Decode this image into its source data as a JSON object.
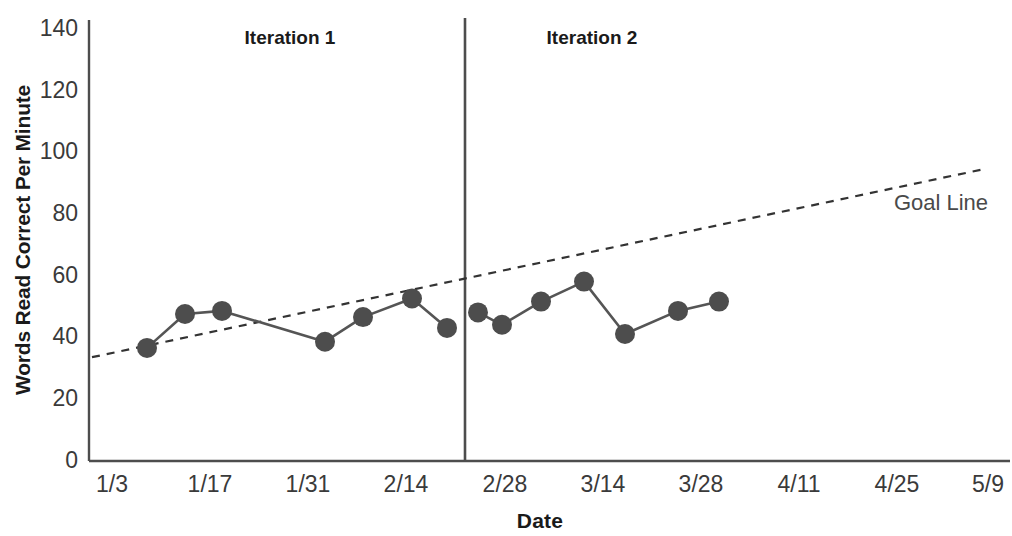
{
  "chart_data": {
    "type": "line",
    "title": "",
    "xlabel": "Date",
    "ylabel": "Words Read Correct Per Minute",
    "ylim": [
      0,
      140
    ],
    "y_ticks": [
      0,
      20,
      40,
      60,
      80,
      100,
      120,
      140
    ],
    "x_ticks": [
      "1/3",
      "1/17",
      "1/31",
      "2/14",
      "2/28",
      "3/14",
      "3/28",
      "4/11",
      "4/25",
      "5/9"
    ],
    "grid": false,
    "legend_position": "inline-annotation",
    "annotations": [
      {
        "name": "phase-label-1",
        "text": "Iteration 1",
        "x_px": 290,
        "y_px": 44
      },
      {
        "name": "phase-label-2",
        "text": "Iteration 2",
        "x_px": 592,
        "y_px": 44
      },
      {
        "name": "goal-line-label",
        "text": "Goal Line",
        "x_px": 941,
        "y_px": 210
      }
    ],
    "phase_divider": {
      "x_label_value": 2.6,
      "x_px": 465
    },
    "series": [
      {
        "name": "Words Read Correct Per Minute",
        "color": "#4d4d4d",
        "style": "solid-with-markers",
        "points": [
          {
            "x_px": 147,
            "y": 36
          },
          {
            "x_px": 185,
            "y": 47
          },
          {
            "x_px": 222,
            "y": 48
          },
          {
            "x_px": 325,
            "y": 38
          },
          {
            "x_px": 363,
            "y": 46
          },
          {
            "x_px": 412,
            "y": 52
          },
          {
            "x_px": 447,
            "y": 42.5
          },
          {
            "x_px": 478,
            "y": 47.5
          },
          {
            "x_px": 502,
            "y": 43.5
          },
          {
            "x_px": 541,
            "y": 51
          },
          {
            "x_px": 584,
            "y": 57.5
          },
          {
            "x_px": 625,
            "y": 40.5
          },
          {
            "x_px": 678,
            "y": 48
          },
          {
            "x_px": 719,
            "y": 51
          }
        ]
      }
    ],
    "goal_line": {
      "name": "Goal Line",
      "style": "dashed",
      "color": "#333333",
      "start": {
        "x_px": 92,
        "y": 33
      },
      "end": {
        "x_px": 985,
        "y": 94
      }
    }
  },
  "axes": {
    "y_axis_title": "Words Read Correct Per Minute",
    "x_axis_title": "Date"
  }
}
